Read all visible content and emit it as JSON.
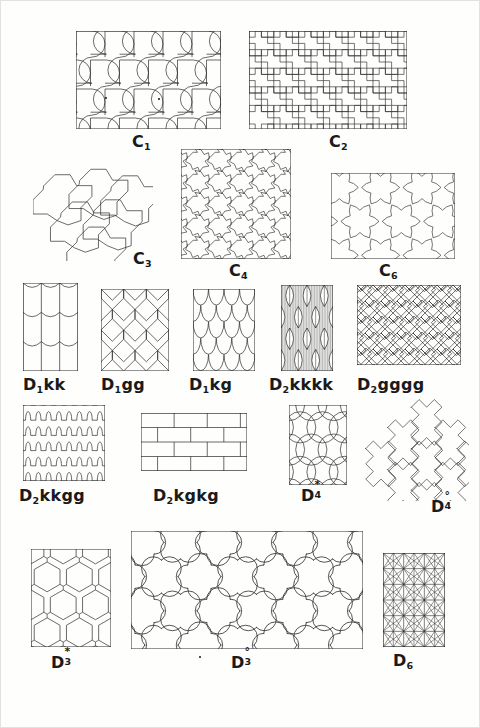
{
  "plate": {
    "title": "Tiling plate",
    "description": "Plate of seventeen isohedral tiling patterns labelled with symmetry-group symbols",
    "ink_color": "#2b2b2b",
    "background_color": "#fefefd",
    "page_border_color": "#e2e2e0"
  },
  "figures": [
    {
      "id": "C1",
      "label_base": "C",
      "label_sub": "1",
      "label_sup": "",
      "pattern": "hook-arc-tiles",
      "description": "Rectangle filled with hook shaped tiles bounded by quarter circle arcs",
      "x": 75,
      "y": 30,
      "w": 145,
      "h": 98,
      "label_x": 131,
      "label_y": 133
    },
    {
      "id": "C2",
      "label_base": "C",
      "label_sub": "2",
      "label_sup": "",
      "pattern": "zigzag-step-tiles",
      "description": "Rectangle filled with interlocking Z shaped stepped polygon tiles",
      "x": 248,
      "y": 30,
      "w": 158,
      "h": 98,
      "label_x": 328,
      "label_y": 133
    },
    {
      "id": "C3",
      "label_base": "C",
      "label_sub": "3",
      "label_sup": "",
      "pattern": "triangular-cluster-hex-tiles",
      "description": "Unbounded triangular cluster of three fold pinwheel hexagon tiles",
      "x": 32,
      "y": 165,
      "w": 120,
      "h": 95,
      "label_x": 132,
      "label_y": 250
    },
    {
      "id": "C4",
      "label_base": "C",
      "label_sub": "4",
      "label_sup": "",
      "pattern": "four-fold-star-tiles",
      "description": "Square filled with four fold pinwheel star shaped tiles",
      "x": 180,
      "y": 148,
      "w": 110,
      "h": 110,
      "label_x": 228,
      "label_y": 262
    },
    {
      "id": "C6",
      "label_base": "C",
      "label_sub": "6",
      "label_sup": "",
      "pattern": "six-fold-star-tiles",
      "description": "Rectangle filled with six fold stepped star tiles",
      "x": 330,
      "y": 172,
      "w": 124,
      "h": 86,
      "label_x": 378,
      "label_y": 262
    },
    {
      "id": "D1kk",
      "label_base": "D",
      "label_sub": "1",
      "label_sup": "",
      "label_suffix": "kk",
      "pattern": "vertical-strip-arcs",
      "description": "Vertical strips of tiles with concave arc tops and bottoms",
      "x": 22,
      "y": 282,
      "w": 55,
      "h": 88,
      "label_x": 22,
      "label_y": 376
    },
    {
      "id": "D1gg",
      "label_base": "D",
      "label_sub": "1",
      "label_sup": "",
      "label_suffix": "gg",
      "pattern": "glide-pentagon-tiles",
      "description": "Rectangle of pentagonal glide reflected tiles",
      "x": 100,
      "y": 288,
      "w": 68,
      "h": 82,
      "label_x": 100,
      "label_y": 376
    },
    {
      "id": "D1kg",
      "label_base": "D",
      "label_sub": "1",
      "label_sup": "",
      "label_suffix": "kg",
      "pattern": "fish-scale",
      "description": "Rectangle of overlapping fish scale semicircle tiles",
      "x": 192,
      "y": 288,
      "w": 62,
      "h": 82,
      "label_x": 188,
      "label_y": 376
    },
    {
      "id": "D2kkkk",
      "label_base": "D",
      "label_sub": "2",
      "label_sup": "",
      "label_suffix": "kkkk",
      "pattern": "lens-diamond-hatched",
      "description": "Rectangle of lens shaped diamond tiles filled with fine vertical hatching",
      "x": 280,
      "y": 284,
      "w": 52,
      "h": 86,
      "label_x": 268,
      "label_y": 376
    },
    {
      "id": "D2gggg",
      "label_base": "D",
      "label_sub": "2",
      "label_sup": "",
      "label_suffix": "gggg",
      "pattern": "herringbone",
      "description": "Rectangle filled with a herringbone parquet of rectangles",
      "x": 356,
      "y": 284,
      "w": 104,
      "h": 80,
      "label_x": 356,
      "label_y": 376
    },
    {
      "id": "D2kkgg",
      "label_base": "D",
      "label_sub": "2",
      "label_sup": "",
      "label_suffix": "kkgg",
      "pattern": "wavy-bands",
      "description": "Square of horizontal bands with square wave scalloped edges",
      "x": 22,
      "y": 404,
      "w": 82,
      "h": 76,
      "label_x": 18,
      "label_y": 487
    },
    {
      "id": "D2kgkg",
      "label_base": "D",
      "label_sub": "2",
      "label_sup": "",
      "label_suffix": "kgkg",
      "pattern": "running-bond-brick",
      "description": "Rectangle of running bond brickwork",
      "x": 140,
      "y": 412,
      "w": 106,
      "h": 58,
      "label_x": 152,
      "label_y": 487
    },
    {
      "id": "D4star",
      "label_base": "D",
      "label_sub": "4",
      "label_sup": "*",
      "pattern": "petal-circle-lattice",
      "description": "Rectangle of interlocking circle arcs forming four petal rosettes",
      "x": 288,
      "y": 404,
      "w": 58,
      "h": 80,
      "label_x": 300,
      "label_y": 485
    },
    {
      "id": "D4circ",
      "label_base": "D",
      "label_sub": "4",
      "label_sup": "°",
      "pattern": "cross-fractal-cluster",
      "description": "Diamond shaped cluster of cross like fractal tiles",
      "x": 358,
      "y": 396,
      "w": 110,
      "h": 104,
      "label_x": 430,
      "label_y": 496
    },
    {
      "id": "D3star",
      "label_base": "D",
      "label_sub": "3",
      "label_sup": "*",
      "pattern": "honeycomb-hexagons",
      "description": "Rectangle of hexagonal honeycomb cells",
      "x": 30,
      "y": 548,
      "w": 80,
      "h": 98,
      "label_x": 50,
      "label_y": 652
    },
    {
      "id": "D3circ",
      "label_base": "D",
      "label_sub": "3",
      "label_sup": "°",
      "pattern": "clover-trefoil-tiles",
      "description": "Large rectangle of rounded trefoil clover shaped tiles",
      "x": 130,
      "y": 530,
      "w": 232,
      "h": 118,
      "label_x": 230,
      "label_y": 652
    },
    {
      "id": "D6",
      "label_base": "D",
      "label_sub": "6",
      "label_sup": "",
      "pattern": "dense-triangular-star-lattice",
      "description": "Rectangle of a dense triangular and star lattice of straight lines",
      "x": 382,
      "y": 552,
      "w": 62,
      "h": 94,
      "label_x": 392,
      "label_y": 652
    }
  ]
}
